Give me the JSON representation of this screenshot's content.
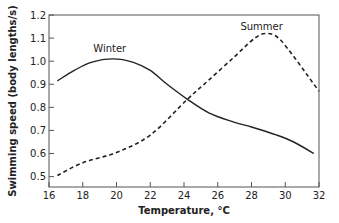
{
  "chart_data": {
    "type": "line",
    "title": "",
    "xlabel": "Temperature, °C",
    "ylabel": "Swimming speed (body lengths/s)",
    "xlim": [
      16,
      32
    ],
    "ylim": [
      0.455,
      1.2
    ],
    "x_ticks": [
      16,
      18,
      20,
      22,
      24,
      26,
      28,
      30,
      32
    ],
    "y_ticks": [
      0.5,
      0.6,
      0.7,
      0.8,
      0.9,
      1.0,
      1.1,
      1.2
    ],
    "y_tick_labels": [
      "0.5",
      "0.6",
      "0.7",
      "0.8",
      "0.9",
      "1.0",
      "1.1",
      "1.2"
    ],
    "grid": false,
    "legend": "inline labels",
    "series": [
      {
        "name": "Winter",
        "style": "solid",
        "label_pos": [
          19.6,
          1.04
        ],
        "points": [
          [
            16.5,
            0.915
          ],
          [
            17.5,
            0.96
          ],
          [
            18.5,
            0.995
          ],
          [
            19.8,
            1.01
          ],
          [
            21,
            0.995
          ],
          [
            22,
            0.96
          ],
          [
            23,
            0.9
          ],
          [
            24.2,
            0.835
          ],
          [
            25.5,
            0.775
          ],
          [
            27,
            0.735
          ],
          [
            28,
            0.715
          ],
          [
            29.5,
            0.68
          ],
          [
            30.5,
            0.65
          ],
          [
            31.7,
            0.6
          ]
        ]
      },
      {
        "name": "Summer",
        "style": "dashed",
        "label_pos": [
          28.6,
          1.135
        ],
        "points": [
          [
            16.5,
            0.505
          ],
          [
            18,
            0.56
          ],
          [
            20,
            0.605
          ],
          [
            22,
            0.68
          ],
          [
            24.2,
            0.835
          ],
          [
            25.5,
            0.92
          ],
          [
            27,
            1.02
          ],
          [
            28.2,
            1.1
          ],
          [
            28.9,
            1.12
          ],
          [
            29.6,
            1.1
          ],
          [
            30.5,
            1.02
          ],
          [
            31.3,
            0.94
          ],
          [
            32,
            0.87
          ]
        ]
      }
    ]
  }
}
